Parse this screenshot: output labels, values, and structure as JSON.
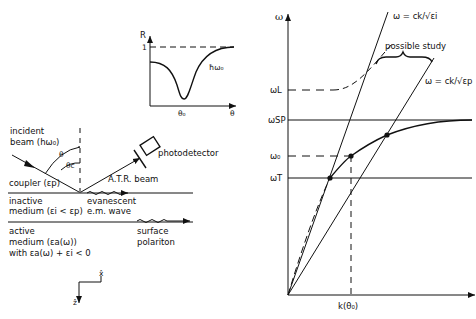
{
  "inset_plot": {
    "y_label": "R",
    "y_tick": "1",
    "x_label": "θ",
    "x_tick": "θ₀",
    "curve_label": "ħω₀"
  },
  "atr_setup": {
    "incident_beam": [
      "incident",
      "beam (hω₀)"
    ],
    "angle_theta": "θ",
    "angle_theta_c": "θc",
    "photodetector": "photodetector",
    "atr_beam": "A.T.R. beam",
    "coupler": "coupler (εp)",
    "inactive_medium": [
      "inactive",
      "medium (εi < εp)"
    ],
    "evanescent": [
      "evanescent",
      "e.m. wave"
    ],
    "active_medium": [
      "active",
      "medium (εa(ω))",
      "with εa(ω) + εi < 0"
    ],
    "surface_polariton": [
      "surface",
      "polariton"
    ],
    "axis_x": "x̂",
    "axis_z": "ẑ"
  },
  "dispersion_plot": {
    "y_label": "ω",
    "levels": {
      "omega_L": "ωL",
      "omega_SP": "ωSP",
      "omega_0": "ω₀",
      "omega_T": "ωT"
    },
    "light_line_i": "ω = ck/√εi",
    "light_line_p": "ω = ck/√εp",
    "possible_study": "possible study",
    "k_tick": "k(θ₀)"
  }
}
